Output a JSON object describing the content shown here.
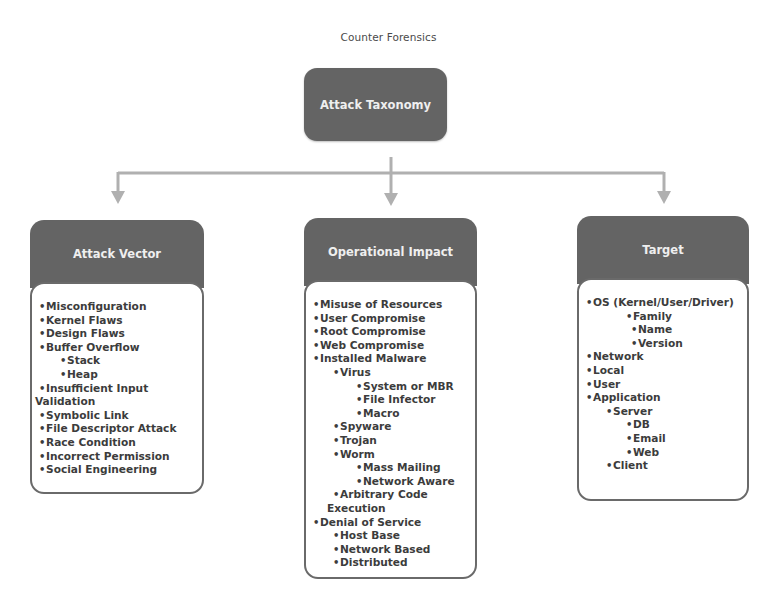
{
  "caption": "Counter Forensics",
  "root": {
    "title": "Attack Taxonomy"
  },
  "colors": {
    "box_fill": "#646464",
    "box_text": "#efefef",
    "body_text": "#3c3c3c",
    "connector": "#b0b0b0"
  },
  "columns": [
    {
      "title": "Attack Vector",
      "items": [
        {
          "level": 0,
          "text": "Misconfiguration"
        },
        {
          "level": 0,
          "text": "Kernel Flaws"
        },
        {
          "level": 0,
          "text": "Design Flaws"
        },
        {
          "level": 0,
          "text": "Buffer Overflow"
        },
        {
          "level": 1,
          "text": "Stack"
        },
        {
          "level": 1,
          "text": "Heap"
        },
        {
          "level": 0,
          "text": "Insufficient Input"
        },
        {
          "level": -1,
          "text": "Validation"
        },
        {
          "level": 0,
          "text": "Symbolic Link"
        },
        {
          "level": 0,
          "text": "File Descriptor Attack"
        },
        {
          "level": 0,
          "text": "Race Condition"
        },
        {
          "level": 0,
          "text": "Incorrect Permission"
        },
        {
          "level": 0,
          "text": "Social Engineering"
        }
      ]
    },
    {
      "title": "Operational Impact",
      "items": [
        {
          "level": 0,
          "text": "Misuse of Resources"
        },
        {
          "level": 0,
          "text": "User Compromise"
        },
        {
          "level": 0,
          "text": "Root Compromise"
        },
        {
          "level": 0,
          "text": "Web Compromise"
        },
        {
          "level": 0,
          "text": "Installed Malware"
        },
        {
          "level": 1,
          "text": "Virus"
        },
        {
          "level": 2,
          "text": "System or MBR"
        },
        {
          "level": 2,
          "text": "File Infector"
        },
        {
          "level": 2,
          "text": "Macro"
        },
        {
          "level": 1,
          "text": "Spyware"
        },
        {
          "level": 1,
          "text": "Trojan"
        },
        {
          "level": 1,
          "text": "Worm"
        },
        {
          "level": 2,
          "text": "Mass Mailing"
        },
        {
          "level": 2,
          "text": "Network Aware"
        },
        {
          "level": 1,
          "text": "Arbitrary Code"
        },
        {
          "level": -2,
          "text": "Execution"
        },
        {
          "level": 0,
          "text": "Denial of Service"
        },
        {
          "level": 1,
          "text": "Host Base"
        },
        {
          "level": 1,
          "text": "Network Based"
        },
        {
          "level": 1,
          "text": "Distributed"
        }
      ]
    },
    {
      "title": "Target",
      "items": [
        {
          "level": 0,
          "text": "OS (Kernel/User/Driver)"
        },
        {
          "level": 2,
          "text": "Family"
        },
        {
          "level": 3,
          "text": "Name"
        },
        {
          "level": 3,
          "text": "Version"
        },
        {
          "level": 0,
          "text": "Network"
        },
        {
          "level": 0,
          "text": "Local"
        },
        {
          "level": 0,
          "text": "User"
        },
        {
          "level": 0,
          "text": "Application"
        },
        {
          "level": 1,
          "text": "Server"
        },
        {
          "level": 2,
          "text": "DB"
        },
        {
          "level": 2,
          "text": "Email"
        },
        {
          "level": 2,
          "text": "Web"
        },
        {
          "level": 1,
          "text": "Client"
        }
      ]
    }
  ]
}
